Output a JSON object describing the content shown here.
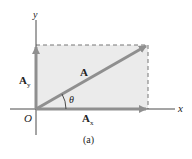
{
  "diagram": {
    "axes": {
      "x_label": "x",
      "y_label": "y",
      "origin_label": "O"
    },
    "vectors": [
      {
        "name": "A",
        "label": "A",
        "description": "resultant vector from origin to upper-right corner"
      },
      {
        "name": "Ax",
        "label": "A",
        "subscript": "x",
        "description": "x-component along x-axis"
      },
      {
        "name": "Ay",
        "label": "A",
        "subscript": "y",
        "description": "y-component along y-axis"
      }
    ],
    "angle_label": "θ",
    "caption": "(a)",
    "colors": {
      "vector": "#8f8f8f",
      "rect_fill": "#ebebeb",
      "axis": "#4a4a4a",
      "dashed": "#777777"
    }
  }
}
